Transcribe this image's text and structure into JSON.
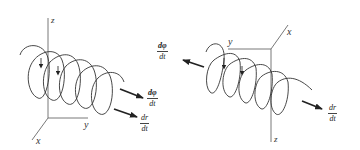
{
  "figure_left": {
    "axes": {
      "z": "z",
      "y": "y",
      "x": "x"
    },
    "arrows": [
      {
        "label_num": "dφ",
        "label_den": "dt",
        "bold_num": true
      },
      {
        "label_num": "dr",
        "label_den": "dt",
        "bold_num": false
      }
    ]
  },
  "figure_right": {
    "axes": {
      "x": "x",
      "y": "y",
      "z": "z"
    },
    "arrows": [
      {
        "label_num": "dφ",
        "label_den": "dt",
        "bold_num": true
      },
      {
        "label_num": "dr",
        "label_den": "dt",
        "bold_num": false
      }
    ]
  },
  "colors": {
    "stroke": "#333333",
    "background": "#ffffff"
  }
}
